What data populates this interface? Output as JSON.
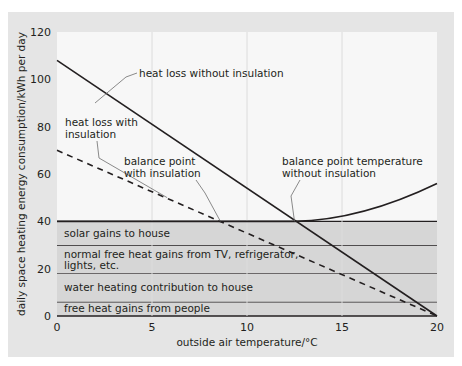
{
  "chart_data": {
    "type": "line",
    "title": "",
    "xlabel": "outside air temperature/°C",
    "ylabel": "daily space heating energy consumption/kWh per day",
    "xlim": [
      0,
      20
    ],
    "ylim": [
      0,
      120
    ],
    "x_ticks": [
      0,
      5,
      10,
      15,
      20
    ],
    "y_ticks": [
      0,
      20,
      40,
      60,
      80,
      100,
      120
    ],
    "x_tick_labels": [
      "0",
      "5",
      "10",
      "15",
      "20"
    ],
    "y_tick_labels": [
      "0",
      "20",
      "40",
      "60",
      "80",
      "100",
      "120"
    ],
    "grid": {
      "vertical": true,
      "horizontal": false
    },
    "legend": null,
    "series": [
      {
        "name": "heat loss without insulation",
        "style": "solid",
        "x": [
          0,
          20
        ],
        "y": [
          108,
          0
        ]
      },
      {
        "name": "heat loss with insulation",
        "style": "dashed",
        "x": [
          0,
          20
        ],
        "y": [
          70,
          0
        ]
      },
      {
        "name": "total free heat gains",
        "style": "solid",
        "x": [
          0,
          12.5,
          14,
          16,
          18,
          20
        ],
        "y": [
          40,
          40,
          41.5,
          44.5,
          49.5,
          56
        ]
      }
    ],
    "bands": [
      {
        "label": "free heat gains from people",
        "from": 0,
        "to": 6
      },
      {
        "label": "water heating contribution to house",
        "from": 6,
        "to": 18
      },
      {
        "label": "normal free heat gains from TV, refrigerator, lights, etc.",
        "from": 18,
        "to": 30
      },
      {
        "label": "solar gains to house",
        "from": 30,
        "to": 40
      }
    ],
    "annotations": [
      {
        "text": "heat loss without insulation",
        "points_to": [
          2,
          90
        ]
      },
      {
        "text": "heat loss with insulation",
        "points_to": [
          5.8,
          50
        ]
      },
      {
        "text": "balance point with insulation",
        "points_to": [
          8.6,
          40
        ]
      },
      {
        "text": "balance point temperature without insulation",
        "points_to": [
          12.5,
          40
        ]
      }
    ]
  },
  "labels": {
    "xlabel": "outside air temperature/°C",
    "ylabel": "daily space heating energy consumption/kWh per day",
    "band_people": "free heat gains from people",
    "band_water": "water heating contribution to house",
    "band_appliances_1": "normal free heat gains from TV, refrigerator,",
    "band_appliances_2": "lights, etc.",
    "band_solar": "solar gains to house",
    "anno_no_insul": "heat loss without insulation",
    "anno_insul_1": "heat loss with",
    "anno_insul_2": "insulation",
    "anno_bp_insul_1": "balance point",
    "anno_bp_insul_2": "with insulation",
    "anno_bp_no_insul_1": "balance point temperature",
    "anno_bp_no_insul_2": "without insulation"
  },
  "colors": {
    "panel": "#e5e5e5",
    "plot_bg": "#f7f7f7",
    "band": "#d6d6d6",
    "line": "#231f20",
    "grid": "#dcdcdc",
    "leader": "#6d6d6d"
  }
}
